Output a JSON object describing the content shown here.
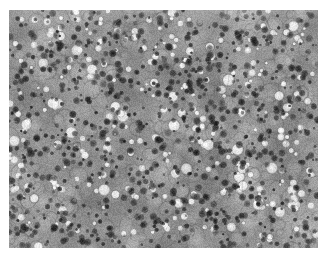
{
  "image": {
    "kind": "micrograph",
    "modality": "light-microscopy",
    "color_mode": "grayscale",
    "caption": "",
    "canvas": {
      "width": 328,
      "height": 258,
      "background": "#ffffff"
    },
    "content_region": {
      "x": 9,
      "y": 10,
      "width": 309,
      "height": 238
    },
    "tones": {
      "background_gray": "#8d8d8d",
      "light_gray": "#c9c9c9",
      "highlight_white": "#f7f7f7",
      "mid_shadow": "#5a5a5a",
      "dark_nucleus": "#1e1e1e",
      "border_white": "#ffffff"
    },
    "texture": {
      "description": "densely packed rounded cells with mottled gray cytoplasm, numerous small dark round nuclei and scattered bright round lipid vacuoles",
      "base_noise_scale": 2.2,
      "cell_count": 520,
      "nucleus_count": 900,
      "vacuole_count": 300,
      "cell_radius_range": [
        4,
        11
      ],
      "nucleus_radius_range": [
        1.2,
        3.4
      ],
      "vacuole_radius_range": [
        1.5,
        6.5
      ],
      "seed": 20240917
    }
  }
}
